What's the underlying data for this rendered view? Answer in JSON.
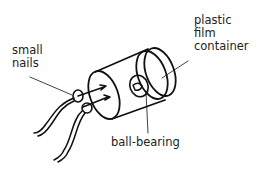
{
  "diagram": {
    "labels": {
      "small_nails_line1": "small",
      "small_nails_line2": "nails",
      "plastic_line1": "plastic",
      "plastic_line2": "film",
      "plastic_line3": "container",
      "ball_bearing": "ball-bearing"
    },
    "colors": {
      "ink": "#111111",
      "text": "#222222",
      "background": "#ffffff"
    }
  }
}
